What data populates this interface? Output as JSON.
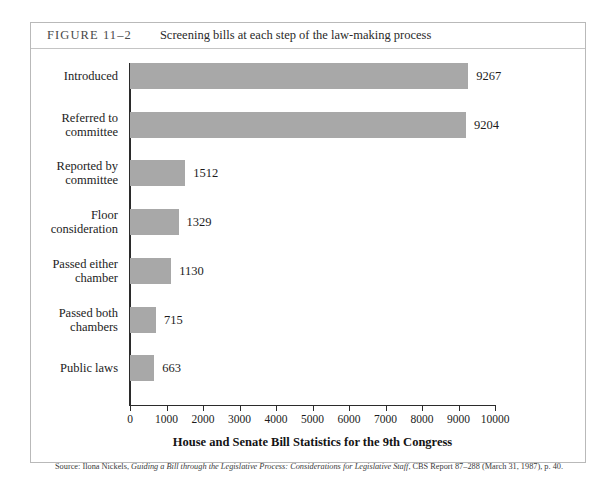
{
  "figure": {
    "number": "FIGURE 11–2",
    "caption": "Screening bills at each step of the law-making process",
    "source_prefix": "Source: Ilona Nickels, ",
    "source_italic": "Guiding a Bill through the Legislative Process: Considerations for Legislative Staff",
    "source_suffix": ", CBS Report 87–288 (March 31, 1987), p. 40."
  },
  "colors": {
    "bar_fill": "#a8a8a8",
    "axis": "#2b2b2b",
    "frame": "#b9b9b9",
    "text": "#1c1c1c"
  },
  "chart_data": {
    "type": "bar",
    "orientation": "horizontal",
    "title": "Screening bills at each step of the law-making process",
    "xlabel": "House and Senate Bill Statistics for the 9th Congress",
    "ylabel": "",
    "xlim": [
      0,
      10000
    ],
    "grid": false,
    "legend": "none",
    "xticks": [
      0,
      1000,
      2000,
      3000,
      4000,
      5000,
      6000,
      7000,
      8000,
      9000,
      10000
    ],
    "xtick_labels": [
      "0",
      "1000",
      "2000",
      "3000",
      "4000",
      "5000",
      "6000",
      "7000",
      "8000",
      "9000",
      "10000"
    ],
    "categories": [
      "Introduced",
      "Referred to committee",
      "Reported by committee",
      "Floor consideration",
      "Passed either chamber",
      "Passed both chambers",
      "Public laws"
    ],
    "values": [
      9267,
      9204,
      1512,
      1329,
      1130,
      715,
      663
    ],
    "data_labels": [
      "9267",
      "9204",
      "1512",
      "1329",
      "1130",
      "715",
      "663"
    ]
  },
  "bars": [
    {
      "label_lines": [
        "Introduced"
      ],
      "value": 9267,
      "value_label": "9267"
    },
    {
      "label_lines": [
        "Referred to",
        "committee"
      ],
      "value": 9204,
      "value_label": "9204"
    },
    {
      "label_lines": [
        "Reported by",
        "committee"
      ],
      "value": 1512,
      "value_label": "1512"
    },
    {
      "label_lines": [
        "Floor",
        "consideration"
      ],
      "value": 1329,
      "value_label": "1329"
    },
    {
      "label_lines": [
        "Passed either",
        "chamber"
      ],
      "value": 1130,
      "value_label": "1130"
    },
    {
      "label_lines": [
        "Passed both",
        "chambers"
      ],
      "value": 715,
      "value_label": "715"
    },
    {
      "label_lines": [
        "Public laws"
      ],
      "value": 663,
      "value_label": "663"
    }
  ]
}
